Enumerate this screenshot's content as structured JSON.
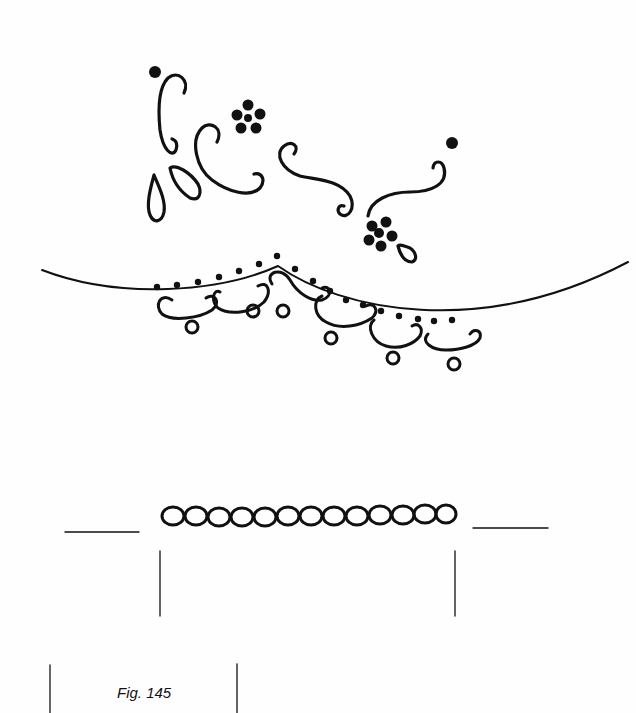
{
  "figure": {
    "caption": "Fig. 145"
  },
  "colors": {
    "ink": "#111111",
    "paper": "#fefefe"
  },
  "chain_band": {
    "link_count": 13
  }
}
